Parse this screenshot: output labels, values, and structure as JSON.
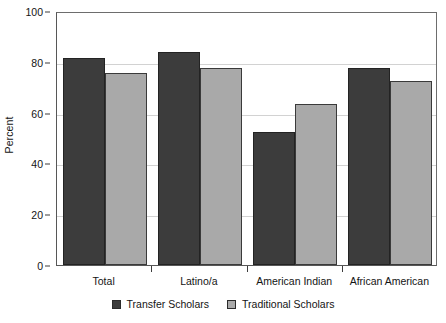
{
  "chart_data": {
    "type": "bar",
    "title": "",
    "subtitle": "",
    "xlabel": "",
    "ylabel": "Percent",
    "ylim": [
      0,
      100
    ],
    "yticks": [
      0,
      20,
      40,
      60,
      80,
      100
    ],
    "ytick_labels": [
      "0",
      "20",
      "40",
      "60",
      "80",
      "100"
    ],
    "grid": true,
    "legend_position": "bottom",
    "categories": [
      "Total",
      "Latino/a",
      "American Indian",
      "African American"
    ],
    "series": [
      {
        "name": "Transfer Scholars",
        "color": "#3c3c3c",
        "values": [
          81.5,
          84.0,
          52.5,
          77.5
        ]
      },
      {
        "name": "Traditional Scholars",
        "color": "#a9a9a9",
        "values": [
          75.5,
          77.5,
          63.5,
          72.5
        ]
      }
    ]
  },
  "legend": {
    "items": [
      {
        "label": "Transfer Scholars",
        "swatch": "dark-square-swatch"
      },
      {
        "label": "Traditional Scholars",
        "swatch": "light-square-swatch"
      }
    ]
  }
}
